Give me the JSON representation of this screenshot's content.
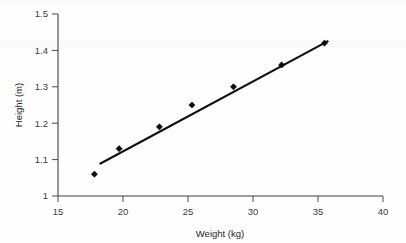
{
  "chart_data": {
    "type": "scatter",
    "title": "",
    "xlabel": "Weight (kg)",
    "ylabel": "Height (m)",
    "xlim": [
      15,
      40
    ],
    "ylim": [
      1.0,
      1.5
    ],
    "xticks": [
      15,
      20,
      25,
      30,
      35,
      40
    ],
    "xtick_labels": [
      "15",
      "20",
      "25",
      "30",
      "35",
      "40"
    ],
    "yticks": [
      1.0,
      1.1,
      1.2,
      1.3,
      1.4,
      1.5
    ],
    "ytick_labels": [
      "1",
      "1.1",
      "1.2",
      "1.3",
      "1.4",
      "1.5"
    ],
    "grid": false,
    "legend": null,
    "x": [
      17.8,
      19.7,
      22.8,
      25.3,
      28.5,
      32.2,
      35.5
    ],
    "y": [
      1.06,
      1.13,
      1.19,
      1.25,
      1.3,
      1.36,
      1.42
    ],
    "series": [
      {
        "name": "observations",
        "marker": "square",
        "marker_color": "#0d0c0d",
        "points": [
          {
            "x": 17.8,
            "y": 1.06
          },
          {
            "x": 19.7,
            "y": 1.13
          },
          {
            "x": 22.8,
            "y": 1.19
          },
          {
            "x": 25.3,
            "y": 1.25
          },
          {
            "x": 28.5,
            "y": 1.3
          },
          {
            "x": 32.2,
            "y": 1.36
          },
          {
            "x": 35.5,
            "y": 1.42
          }
        ]
      },
      {
        "name": "line-of-best-fit",
        "type": "line",
        "line_color": "#100f10",
        "endpoints": [
          {
            "x": 18.2,
            "y": 1.088
          },
          {
            "x": 35.8,
            "y": 1.426
          }
        ]
      }
    ]
  }
}
